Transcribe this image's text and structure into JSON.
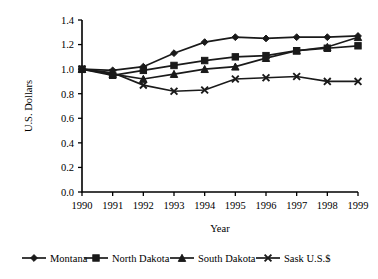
{
  "chart_data": {
    "type": "line",
    "title": "",
    "xlabel": "Year",
    "ylabel": "U.S. Dollars",
    "categories": [
      "1990",
      "1991",
      "1992",
      "1993",
      "1994",
      "1995",
      "1996",
      "1997",
      "1998",
      "1999"
    ],
    "x": [
      1990,
      1991,
      1992,
      1993,
      1994,
      1995,
      1996,
      1997,
      1998,
      1999
    ],
    "xlim": [
      1990,
      1999
    ],
    "ylim": [
      0.0,
      1.4
    ],
    "yticks": [
      "0.0",
      "0.2",
      "0.4",
      "0.6",
      "0.8",
      "1.0",
      "1.2",
      "1.4"
    ],
    "ytick_values": [
      0.0,
      0.2,
      0.4,
      0.6,
      0.8,
      1.0,
      1.2,
      1.4
    ],
    "grid": false,
    "legend_position": "bottom",
    "series": [
      {
        "name": "Montana",
        "marker": "diamond",
        "color": "#1a1a1a",
        "values": [
          1.0,
          0.99,
          1.02,
          1.13,
          1.22,
          1.26,
          1.25,
          1.26,
          1.26,
          1.27
        ]
      },
      {
        "name": "North Dakota",
        "marker": "square",
        "color": "#1a1a1a",
        "values": [
          1.0,
          0.95,
          0.99,
          1.03,
          1.07,
          1.1,
          1.11,
          1.15,
          1.17,
          1.19
        ]
      },
      {
        "name": "South Dakota",
        "marker": "triangle",
        "color": "#1a1a1a",
        "values": [
          1.0,
          0.96,
          0.92,
          0.96,
          1.0,
          1.02,
          1.09,
          1.15,
          1.18,
          1.26
        ]
      },
      {
        "name": "Sask U.S.$",
        "marker": "x",
        "color": "#1a1a1a",
        "values": [
          1.0,
          0.97,
          0.87,
          0.82,
          0.83,
          0.92,
          0.93,
          0.94,
          0.9,
          0.9
        ]
      }
    ]
  },
  "legend": {
    "entries": [
      {
        "label": "Montana"
      },
      {
        "label": "North Dakota"
      },
      {
        "label": "South Dakota"
      },
      {
        "label": "Sask U.S.$"
      }
    ]
  }
}
